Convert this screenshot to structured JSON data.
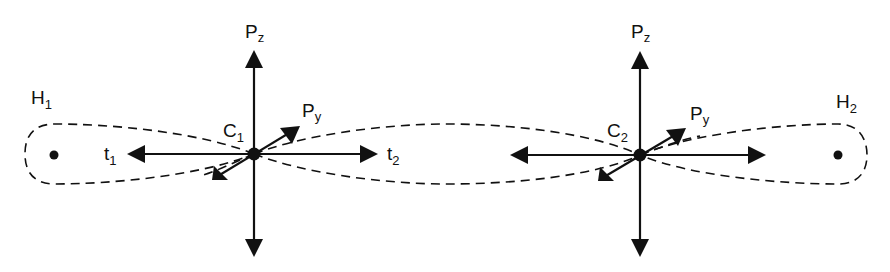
{
  "diagram": {
    "type": "molecular-orbital-diagram",
    "colors": {
      "stroke": "#111111",
      "background": "#ffffff"
    },
    "atoms": [
      {
        "id": "H1",
        "label": "H",
        "subscript": "1"
      },
      {
        "id": "C1",
        "label": "C",
        "subscript": "1"
      },
      {
        "id": "C2",
        "label": "C",
        "subscript": "2"
      },
      {
        "id": "H2",
        "label": "H",
        "subscript": "2"
      }
    ],
    "c1": {
      "pz": {
        "label": "P",
        "subscript": "z"
      },
      "py": {
        "label": "P",
        "subscript": "y"
      },
      "t1": {
        "label": "t",
        "subscript": "1"
      },
      "t2": {
        "label": "t",
        "subscript": "2"
      }
    },
    "c2": {
      "pz": {
        "label": "P",
        "subscript": "z"
      },
      "py": {
        "label": "P",
        "subscript": "y"
      }
    },
    "bonds": [
      {
        "from": "H1",
        "to": "C1",
        "style": "dashed-lobe"
      },
      {
        "from": "C1",
        "to": "C2",
        "style": "dashed-lobe"
      },
      {
        "from": "C2",
        "to": "H2",
        "style": "dashed-lobe"
      }
    ]
  }
}
